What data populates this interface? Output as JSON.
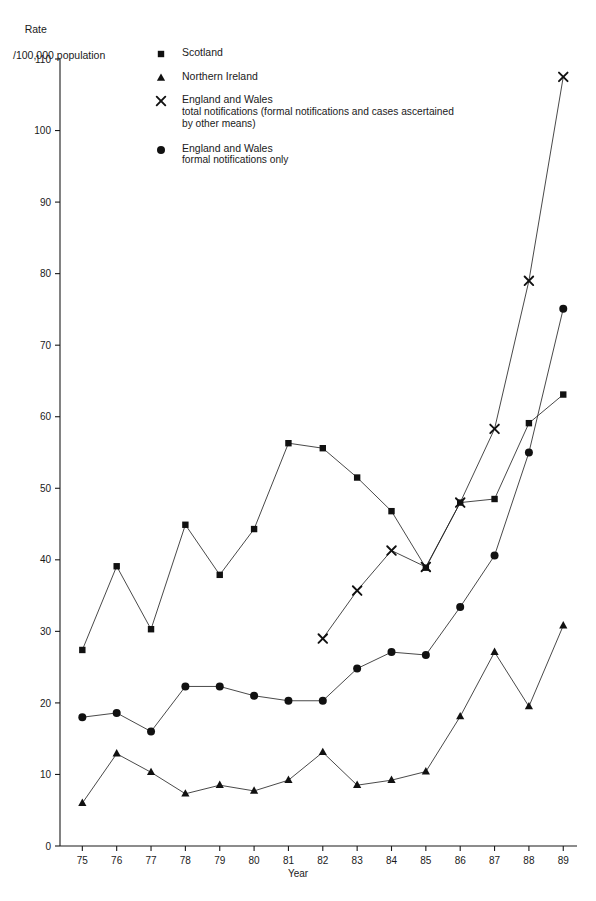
{
  "axes": {
    "y_title_line1": "Rate",
    "y_title_line2": "/100,000 population",
    "x_title": "Year"
  },
  "legend": {
    "items": [
      {
        "marker": "square",
        "label": "Scotland",
        "sub": ""
      },
      {
        "marker": "triangle",
        "label": "Northern Ireland",
        "sub": ""
      },
      {
        "marker": "cross",
        "label": "England and Wales",
        "sub": "total notifications (formal notifications and cases ascertained by other means)"
      },
      {
        "marker": "circle",
        "label": "England and Wales",
        "sub": "formal notifications only"
      }
    ]
  },
  "chart_data": {
    "type": "line",
    "title": "",
    "xlabel": "Year",
    "ylabel": "Rate /100,000 population",
    "xlim": [
      74.5,
      89.5
    ],
    "ylim": [
      0,
      110
    ],
    "ytick_step": 10,
    "grid": false,
    "legend_position": "top-center",
    "x": [
      75,
      76,
      77,
      78,
      79,
      80,
      81,
      82,
      83,
      84,
      85,
      86,
      87,
      88,
      89
    ],
    "xtick_labels": [
      "75",
      "76",
      "77",
      "78",
      "79",
      "80",
      "81",
      "82",
      "83",
      "84",
      "85",
      "86",
      "87",
      "88",
      "89"
    ],
    "ytick_labels": [
      "0",
      "10",
      "20",
      "30",
      "40",
      "50",
      "60",
      "70",
      "80",
      "90",
      "100",
      "110"
    ],
    "series": [
      {
        "name": "Scotland",
        "marker": "square",
        "x": [
          75,
          76,
          77,
          78,
          79,
          80,
          81,
          82,
          83,
          84,
          85,
          86,
          87,
          88,
          89
        ],
        "values": [
          27.4,
          39.1,
          30.3,
          44.9,
          37.9,
          44.3,
          56.3,
          55.6,
          51.5,
          46.8,
          38.9,
          48.0,
          48.5,
          59.1,
          63.1
        ]
      },
      {
        "name": "Northern Ireland",
        "marker": "triangle",
        "x": [
          75,
          76,
          77,
          78,
          79,
          80,
          81,
          82,
          83,
          84,
          85,
          86,
          87,
          88,
          89
        ],
        "values": [
          6.0,
          12.9,
          10.3,
          7.3,
          8.5,
          7.7,
          9.2,
          13.1,
          8.5,
          9.2,
          10.4,
          18.1,
          27.1,
          19.5,
          30.8
        ]
      },
      {
        "name": "England and Wales total notifications (formal notifications and cases ascertained by other means)",
        "marker": "cross",
        "x": [
          82,
          83,
          84,
          85,
          86,
          87,
          88,
          89
        ],
        "values": [
          29.0,
          35.7,
          41.3,
          39.0,
          48.0,
          58.3,
          79.0,
          107.5
        ]
      },
      {
        "name": "England and Wales formal notifications only",
        "marker": "circle",
        "x": [
          75,
          76,
          77,
          78,
          79,
          80,
          81,
          82,
          83,
          84,
          85,
          86,
          87,
          88,
          89
        ],
        "values": [
          18.0,
          18.6,
          16.0,
          22.3,
          22.3,
          21.0,
          20.3,
          20.3,
          24.8,
          27.1,
          26.7,
          33.4,
          40.6,
          55.0,
          75.1
        ]
      }
    ]
  }
}
